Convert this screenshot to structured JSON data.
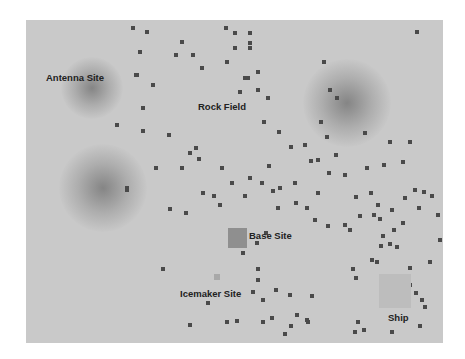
{
  "map": {
    "origin": [
      26,
      20
    ],
    "size": [
      417,
      323
    ],
    "background": "#c9c9c9",
    "rock_color": "#4a4a4a"
  },
  "labels": {
    "antenna": "Antenna Site",
    "rock_field": "Rock Field",
    "base": "Base Site",
    "icemaker": "Icemaker Site",
    "ship": "Ship"
  },
  "glows": [
    {
      "name": "antenna-glow",
      "cx": 92,
      "cy": 88,
      "r": 28
    },
    {
      "name": "east-glow",
      "cx": 347,
      "cy": 103,
      "r": 40
    },
    {
      "name": "southwest-glow",
      "cx": 103,
      "cy": 188,
      "r": 40
    }
  ],
  "sites": [
    {
      "name": "base-site",
      "x": 228,
      "y": 228,
      "w": 19,
      "h": 20,
      "color": "#8f8f8f"
    },
    {
      "name": "icemaker-site",
      "x": 214,
      "y": 274,
      "w": 6,
      "h": 6,
      "color": "#a8a8a8"
    },
    {
      "name": "ship-site",
      "x": 379,
      "y": 274,
      "w": 32,
      "h": 34,
      "color": "#bdbdbd"
    }
  ],
  "rocks": [
    [
      133,
      28
    ],
    [
      147,
      32
    ],
    [
      140,
      52
    ],
    [
      176,
      55
    ],
    [
      193,
      55
    ],
    [
      202,
      68
    ],
    [
      226,
      28
    ],
    [
      235,
      33
    ],
    [
      250,
      33
    ],
    [
      235,
      48
    ],
    [
      250,
      43
    ],
    [
      258,
      72
    ],
    [
      248,
      78
    ],
    [
      240,
      92
    ],
    [
      245,
      78
    ],
    [
      136,
      75
    ],
    [
      153,
      85
    ],
    [
      143,
      108
    ],
    [
      117,
      125
    ],
    [
      143,
      131
    ],
    [
      169,
      135
    ],
    [
      196,
      148
    ],
    [
      190,
      153
    ],
    [
      199,
      159
    ],
    [
      222,
      168
    ],
    [
      156,
      168
    ],
    [
      182,
      168
    ],
    [
      137,
      75
    ],
    [
      182,
      42
    ],
    [
      227,
      62
    ],
    [
      250,
      48
    ],
    [
      258,
      90
    ],
    [
      268,
      98
    ],
    [
      264,
      122
    ],
    [
      279,
      132
    ],
    [
      291,
      147
    ],
    [
      305,
      145
    ],
    [
      327,
      137
    ],
    [
      336,
      155
    ],
    [
      311,
      161
    ],
    [
      324,
      62
    ],
    [
      330,
      90
    ],
    [
      337,
      98
    ],
    [
      321,
      122
    ],
    [
      365,
      133
    ],
    [
      390,
      142
    ],
    [
      417,
      32
    ],
    [
      410,
      142
    ],
    [
      403,
      162
    ],
    [
      384,
      165
    ],
    [
      367,
      168
    ],
    [
      318,
      160
    ],
    [
      269,
      166
    ],
    [
      262,
      183
    ],
    [
      280,
      188
    ],
    [
      295,
      183
    ],
    [
      296,
      203
    ],
    [
      318,
      193
    ],
    [
      329,
      173
    ],
    [
      345,
      175
    ],
    [
      356,
      197
    ],
    [
      371,
      193
    ],
    [
      378,
      205
    ],
    [
      374,
      215
    ],
    [
      380,
      219
    ],
    [
      392,
      210
    ],
    [
      405,
      198
    ],
    [
      415,
      190
    ],
    [
      424,
      192
    ],
    [
      432,
      196
    ],
    [
      419,
      208
    ],
    [
      438,
      215
    ],
    [
      440,
      240
    ],
    [
      430,
      262
    ],
    [
      273,
      191
    ],
    [
      250,
      178
    ],
    [
      245,
      196
    ],
    [
      232,
      183
    ],
    [
      220,
      205
    ],
    [
      203,
      193
    ],
    [
      170,
      209
    ],
    [
      186,
      213
    ],
    [
      214,
      196
    ],
    [
      127,
      188
    ],
    [
      127,
      190
    ],
    [
      278,
      208
    ],
    [
      307,
      208
    ],
    [
      315,
      220
    ],
    [
      328,
      226
    ],
    [
      345,
      225
    ],
    [
      350,
      230
    ],
    [
      360,
      216
    ],
    [
      394,
      230
    ],
    [
      383,
      236
    ],
    [
      390,
      244
    ],
    [
      381,
      246
    ],
    [
      403,
      223
    ],
    [
      397,
      247
    ],
    [
      377,
      262
    ],
    [
      353,
      269
    ],
    [
      356,
      278
    ],
    [
      372,
      260
    ],
    [
      410,
      268
    ],
    [
      416,
      293
    ],
    [
      422,
      300
    ],
    [
      410,
      285
    ],
    [
      425,
      307
    ],
    [
      257,
      243
    ],
    [
      266,
      233
    ],
    [
      243,
      253
    ],
    [
      258,
      269
    ],
    [
      258,
      280
    ],
    [
      253,
      292
    ],
    [
      263,
      300
    ],
    [
      276,
      290
    ],
    [
      290,
      295
    ],
    [
      312,
      296
    ],
    [
      297,
      315
    ],
    [
      308,
      322
    ],
    [
      272,
      318
    ],
    [
      227,
      322
    ],
    [
      237,
      321
    ],
    [
      263,
      322
    ],
    [
      285,
      334
    ],
    [
      291,
      326
    ],
    [
      307,
      320
    ],
    [
      358,
      322
    ],
    [
      355,
      332
    ],
    [
      364,
      330
    ],
    [
      392,
      332
    ],
    [
      420,
      326
    ],
    [
      163,
      269
    ],
    [
      208,
      303
    ],
    [
      190,
      325
    ]
  ]
}
